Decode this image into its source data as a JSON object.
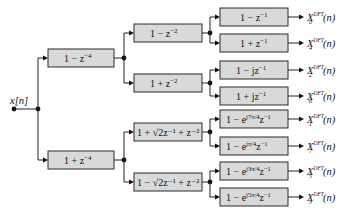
{
  "input": {
    "label": "x[n]"
  },
  "stage1": [
    {
      "id": "s1a",
      "label": "1 − z",
      "exp": "−4"
    },
    {
      "id": "s1b",
      "label": "1 + z",
      "exp": "−4"
    }
  ],
  "stage2": [
    {
      "id": "s2a",
      "label": "1 − z",
      "exp": "−2"
    },
    {
      "id": "s2b",
      "label": "1 + z",
      "exp": "−2"
    },
    {
      "id": "s2c",
      "label": "1 + √2z⁻¹ + z⁻²"
    },
    {
      "id": "s2d",
      "label": "1 − √2z⁻¹ + z⁻²"
    }
  ],
  "stage3": [
    {
      "label": "1 − z",
      "exp": "−1"
    },
    {
      "label": "1 + z",
      "exp": "−1"
    },
    {
      "label": "1 − jz",
      "exp": "−1"
    },
    {
      "label": "1 + jz",
      "exp": "−1"
    },
    {
      "label": "1 − e",
      "eexp": "j7π/4",
      "tail": "z",
      "exp": "−1"
    },
    {
      "label": "1 − e",
      "eexp": "jπ/4",
      "tail": "z",
      "exp": "−1"
    },
    {
      "label": "1 − e",
      "eexp": "j3π/4",
      "tail": "z",
      "exp": "−1"
    },
    {
      "label": "1 − e",
      "eexp": "j5π/4",
      "tail": "z",
      "exp": "−1"
    }
  ],
  "outputs": [
    {
      "base": "X",
      "sub": "0",
      "sup": "DFT",
      "arg": "(n)"
    },
    {
      "base": "X",
      "sub": "4",
      "sup": "DFT",
      "arg": "(n)"
    },
    {
      "base": "X",
      "sub": "2",
      "sup": "DFT",
      "arg": "(n)"
    },
    {
      "base": "X",
      "sub": "6",
      "sup": "DFT",
      "arg": "(n)"
    },
    {
      "base": "X",
      "sub": "1",
      "sup": "DFT",
      "arg": "(n)"
    },
    {
      "base": "X",
      "sub": "7",
      "sup": "DFT",
      "arg": "(n)"
    },
    {
      "base": "X",
      "sub": "5",
      "sup": "DFT",
      "arg": "(n)"
    },
    {
      "base": "X",
      "sub": "3",
      "sup": "DFT",
      "arg": "(n)"
    }
  ]
}
